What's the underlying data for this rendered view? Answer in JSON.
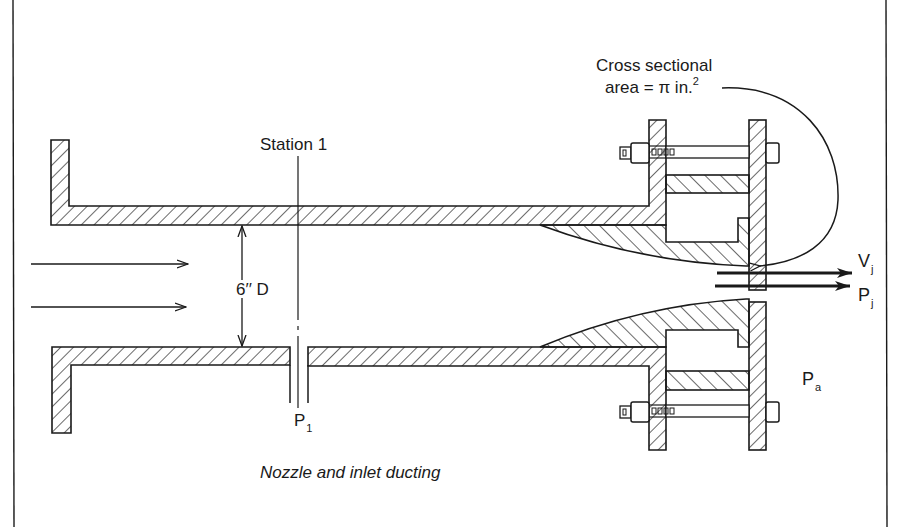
{
  "figure": {
    "title_cutoff": "",
    "labels": {
      "cross_section_line1": "Cross sectional",
      "cross_section_line2": "area = π in.",
      "cross_section_exp": "2",
      "station": "Station 1",
      "diameter": "6′′ D",
      "p1_main": "P",
      "p1_sub": "1",
      "vj_main": "V",
      "vj_sub": "j",
      "pj_main": "P",
      "pj_sub": "j",
      "pa_main": "P",
      "pa_sub": "a",
      "caption": "Nozzle and inlet ducting"
    },
    "colors": {
      "ink": "#1a1a1a",
      "background": "#ffffff"
    },
    "components": [
      "inlet-duct",
      "left-flange",
      "pressure-tap-p1",
      "nozzle-contraction",
      "bolted-flange-joint",
      "jet-exit"
    ]
  }
}
